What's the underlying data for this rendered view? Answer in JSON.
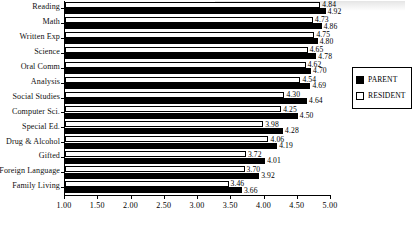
{
  "chart_data": {
    "type": "bar",
    "orientation": "horizontal",
    "title": "",
    "xlabel": "",
    "ylabel": "",
    "xlim": [
      1.0,
      5.0
    ],
    "xticks": [
      "1.00",
      "1.50",
      "2.00",
      "2.50",
      "3.00",
      "3.50",
      "4.00",
      "4.50",
      "5.00"
    ],
    "xtick_step": 0.5,
    "grid": false,
    "legend_position": "right",
    "categories": [
      "Reading",
      "Math",
      "Written Exp",
      "Science",
      "Oral Comm",
      "Analysis",
      "Social Studies",
      "Computer Sci.",
      "Special Ed.",
      "Drug & Alcohol",
      "Gifted",
      "Foreign Language",
      "Family Living"
    ],
    "series": [
      {
        "name": "RESIDENT",
        "color": "#ffffff",
        "values": [
          4.84,
          4.73,
          4.75,
          4.65,
          4.62,
          4.54,
          4.3,
          4.25,
          3.98,
          4.06,
          3.72,
          3.7,
          3.46
        ],
        "labels": [
          "4.84",
          "4.73",
          "4.75",
          "4.65",
          "4.62",
          "4.54",
          "4.30",
          "4.25",
          "3.98",
          "4.06",
          "3.72",
          "3.70",
          "3.46"
        ]
      },
      {
        "name": "PARENT",
        "color": "#000000",
        "values": [
          4.92,
          4.86,
          4.8,
          4.78,
          4.7,
          4.69,
          4.64,
          4.5,
          4.28,
          4.19,
          4.01,
          3.92,
          3.66
        ],
        "labels": [
          "4.92",
          "4.86",
          "4.80",
          "4.78",
          "4.70",
          "4.69",
          "4.64",
          "4.50",
          "4.28",
          "4.19",
          "4.01",
          "3.92",
          "3.66"
        ]
      }
    ]
  },
  "legend": {
    "items": [
      {
        "label": "PARENT",
        "color": "#000000"
      },
      {
        "label": "RESIDENT",
        "color": "#ffffff"
      }
    ]
  }
}
